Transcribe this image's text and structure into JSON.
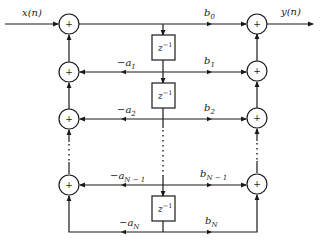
{
  "diagram": {
    "type": "direct-form-II IIR filter structure",
    "input_label": "x(n)",
    "output_label": "y(n)",
    "adder_symbol": "+",
    "delay_label": "z",
    "delay_exp": "−1",
    "feedback_coeffs": [
      {
        "sign": "−",
        "base": "a",
        "sub": "1"
      },
      {
        "sign": "−",
        "base": "a",
        "sub": "2"
      },
      {
        "sign": "−",
        "base": "a",
        "sub": "N − 1"
      },
      {
        "sign": "−",
        "base": "a",
        "sub": "N"
      }
    ],
    "feedforward_coeffs": [
      {
        "base": "b",
        "sub": "0"
      },
      {
        "base": "b",
        "sub": "1"
      },
      {
        "base": "b",
        "sub": "2"
      },
      {
        "base": "b",
        "sub": "N − 1"
      },
      {
        "base": "b",
        "sub": "N"
      }
    ],
    "line_color": "#1a1a1a",
    "background": "#ffffff"
  }
}
